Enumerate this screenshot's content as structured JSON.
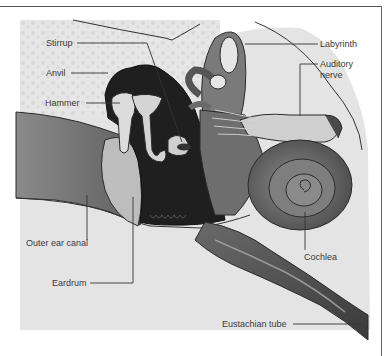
{
  "figure": {
    "labels": {
      "stirrup": "Stirrup",
      "anvil": "Anvil",
      "hammer": "Hammer",
      "labyrinth": "Labyrinth",
      "auditory_nerve_line1": "Auditory",
      "auditory_nerve_line2": "nerve",
      "outer_ear_canal": "Outer ear canal",
      "eardrum": "Eardrum",
      "cochlea": "Cochlea",
      "eustachian_tube": "Eustachian tube"
    },
    "colors": {
      "background": "#ffffff",
      "bone_speckle": "#e2e2e2",
      "soft_tissue": "#d6d6d6",
      "canal_dark": "#6e6e6e",
      "middle_ear_dark": "#1e1e1e",
      "inner_ear_mid": "#7a7a7a",
      "ossicle_light": "#d9d9d9",
      "outline": "#2a2a2a",
      "leader_line": "#333333"
    }
  }
}
